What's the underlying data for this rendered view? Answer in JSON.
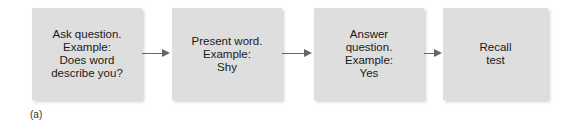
{
  "diagram": {
    "steps": [
      {
        "label": "Ask question.\nExample:\nDoes word\ndescribe you?"
      },
      {
        "label": "Present word.\nExample:\nShy"
      },
      {
        "label": "Answer\nquestion.\nExample:\nYes"
      },
      {
        "label": "Recall\ntest"
      }
    ],
    "panel_label": "(a)"
  }
}
